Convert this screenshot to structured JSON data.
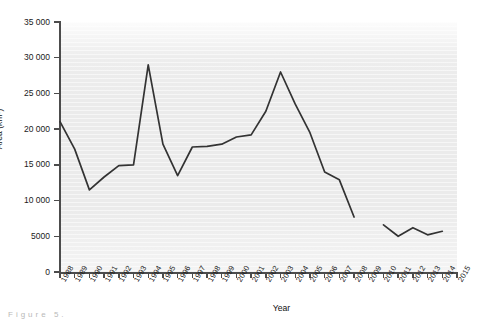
{
  "figure": {
    "background_color": "#ffffff",
    "plot_background_color": "#ebebeb",
    "line_color": "#333333",
    "axis_color": "#4c4c4c",
    "caption_fragment": "Figure 5."
  },
  "chart_data": {
    "type": "line",
    "title": "",
    "xlabel": "Year",
    "ylabel": "Area (km²)",
    "ylim": [
      0,
      35000
    ],
    "ytick_values": [
      0,
      5000,
      10000,
      15000,
      20000,
      25000,
      30000,
      35000
    ],
    "ytick_labels": [
      "0",
      "5000",
      "10 000",
      "15 000",
      "20 000",
      "25 000",
      "30 000",
      "35 000"
    ],
    "xlim": [
      1988,
      2015
    ],
    "xtick_labels": [
      "1988",
      "1989",
      "1990",
      "1991",
      "1992",
      "1993",
      "1994",
      "1995",
      "1996",
      "1997",
      "1998",
      "1999",
      "2000",
      "2001",
      "2002",
      "2003",
      "2004",
      "2005",
      "2006",
      "2007",
      "2008",
      "2009",
      "2010",
      "2011",
      "2012",
      "2013",
      "2014",
      "2015"
    ],
    "grid": false,
    "legend": "none",
    "series": [
      {
        "name": "Area",
        "x": [
          1988,
          1989,
          1990,
          1991,
          1992,
          1993,
          1994,
          1995,
          1996,
          1997,
          1998,
          1999,
          2000,
          2001,
          2002,
          2003,
          2004,
          2005,
          2006,
          2007,
          2008
        ],
        "values": [
          21050,
          17200,
          11500,
          13300,
          14900,
          15000,
          29000,
          17900,
          13500,
          17500,
          17600,
          17900,
          18900,
          19200,
          22500,
          28000,
          23500,
          19500,
          14000,
          12900,
          7700
        ]
      },
      {
        "name": "Area",
        "x": [
          2010,
          2011,
          2012,
          2013,
          2014
        ],
        "values": [
          6600,
          5000,
          6200,
          5200,
          5700
        ]
      }
    ],
    "gap_years": [
      2009
    ]
  }
}
